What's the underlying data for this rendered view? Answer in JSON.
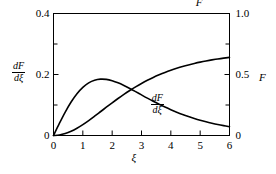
{
  "chart_data": {
    "type": "line",
    "title": "",
    "xlabel": "ξ",
    "ylabel_left": "dF/dξ",
    "ylabel_right": "F",
    "xlim": [
      0,
      6
    ],
    "ylim_left": [
      0,
      0.4
    ],
    "ylim_right": [
      0,
      1.0
    ],
    "grid": false,
    "legend_position": "inline-curve-labels",
    "x_ticks": [
      "0",
      "1",
      "2",
      "3",
      "4",
      "5",
      "6"
    ],
    "x_tick_values": [
      0,
      1,
      2,
      3,
      4,
      5,
      6
    ],
    "x_minor_ticks": [],
    "y_left_ticks": [
      "0",
      "0.2",
      "0.4"
    ],
    "y_left_tick_values": [
      0,
      0.2,
      0.4
    ],
    "y_left_minor_tick_values": [
      0.1,
      0.3
    ],
    "y_right_ticks": [
      "0",
      "0.5",
      "1.0"
    ],
    "y_right_tick_values": [
      0,
      0.5,
      1.0
    ],
    "y_right_minor_tick_values": [
      0.25,
      0.75
    ],
    "series": [
      {
        "name": "dF/dξ",
        "axis": "left",
        "label_text_numerator": "dF",
        "label_text_denominator": "dξ",
        "color": "#000000",
        "x": [
          0.0,
          0.2,
          0.4,
          0.6,
          0.8,
          1.0,
          1.2,
          1.4,
          1.6,
          1.8,
          2.0,
          2.2,
          2.4,
          2.6,
          2.8,
          3.0,
          3.2,
          3.4,
          3.6,
          3.8,
          4.0,
          4.2,
          4.4,
          4.6,
          4.8,
          5.0,
          5.2,
          5.4,
          5.6,
          5.8,
          6.0
        ],
        "values": [
          0.0,
          0.0396,
          0.0769,
          0.1098,
          0.1371,
          0.158,
          0.1726,
          0.1813,
          0.1848,
          0.184,
          0.1797,
          0.1728,
          0.1641,
          0.1543,
          0.1438,
          0.1331,
          0.1225,
          0.1122,
          0.1024,
          0.0931,
          0.0844,
          0.0764,
          0.069,
          0.0622,
          0.056,
          0.0503,
          0.0451,
          0.0404,
          0.0361,
          0.0323,
          0.0288
        ]
      },
      {
        "name": "F",
        "axis": "right",
        "label_text": "F",
        "color": "#000000",
        "x": [
          0.0,
          0.2,
          0.4,
          0.6,
          0.8,
          1.0,
          1.2,
          1.4,
          1.6,
          1.8,
          2.0,
          2.2,
          2.4,
          2.6,
          2.8,
          3.0,
          3.2,
          3.4,
          3.6,
          3.8,
          4.0,
          4.2,
          4.4,
          4.6,
          4.8,
          5.0,
          5.2,
          5.4,
          5.6,
          5.8,
          6.0
        ],
        "values": [
          0.0,
          0.004,
          0.0158,
          0.0345,
          0.0594,
          0.0892,
          0.1225,
          0.158,
          0.1947,
          0.2316,
          0.268,
          0.3034,
          0.3372,
          0.3691,
          0.399,
          0.4267,
          0.4523,
          0.4758,
          0.4972,
          0.5168,
          0.5347,
          0.5508,
          0.5655,
          0.5787,
          0.5906,
          0.6013,
          0.6109,
          0.6196,
          0.6273,
          0.6342,
          0.6404
        ]
      }
    ],
    "annotations": [
      {
        "text": "F",
        "x": 4.95,
        "y_axis": "right",
        "y": 1.02
      },
      {
        "text": "dF/dξ",
        "x": 3.55,
        "y_axis": "left",
        "y": 0.165
      }
    ]
  },
  "axes": {
    "left_axis_label": {
      "numerator": "dF",
      "denominator": "dξ"
    },
    "right_axis_label": "F",
    "x_axis_label": "ξ",
    "x_tick_labels": [
      "0",
      "1",
      "2",
      "3",
      "4",
      "5",
      "6"
    ],
    "y_left_tick_labels": [
      "0",
      "0.2",
      "0.4"
    ],
    "y_right_tick_labels": [
      "0",
      "0.5",
      "1.0"
    ]
  },
  "curve_labels": {
    "upper": "F",
    "lower_numerator": "dF",
    "lower_denominator": "dξ"
  },
  "style": {
    "background": "#ffffff",
    "line_color": "#000000",
    "axis_color": "#000000"
  }
}
